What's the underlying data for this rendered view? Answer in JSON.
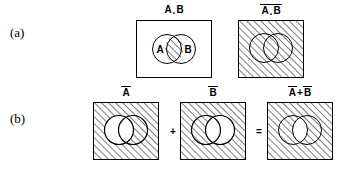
{
  "figure": {
    "rows": [
      {
        "id": "a",
        "label": "(a)",
        "panels": [
          {
            "id": "a-and-b",
            "label_parts": {
              "left": "A",
              "op": ".",
              "right": "B"
            },
            "label_plain": "A . B",
            "overbar": "none",
            "fill": "white",
            "shaded_region": "intersection",
            "circle_labels": {
              "left": "A",
              "right": "B"
            },
            "show_circle_labels": true
          },
          {
            "id": "not-a-and-b",
            "label_parts": {
              "left": "A",
              "op": ".",
              "right": "B"
            },
            "label_plain": "A . B",
            "overbar": "full",
            "fill": "hatched",
            "shaded_region": "everything",
            "circle_labels": {
              "left": "",
              "right": ""
            },
            "show_circle_labels": false
          }
        ]
      },
      {
        "id": "b",
        "label": "(b)",
        "panels": [
          {
            "id": "not-a",
            "label_parts": {
              "left": "A",
              "op": "",
              "right": ""
            },
            "label_plain": "A",
            "overbar": "left",
            "fill": "hatched",
            "shaded_region": "outside-circle-a",
            "circle_labels": {
              "left": "",
              "right": ""
            },
            "show_circle_labels": false
          },
          {
            "id": "not-b",
            "label_parts": {
              "left": "B",
              "op": "",
              "right": ""
            },
            "label_plain": "B",
            "overbar": "left",
            "fill": "hatched",
            "shaded_region": "outside-circle-b",
            "circle_labels": {
              "left": "",
              "right": ""
            },
            "show_circle_labels": false
          },
          {
            "id": "not-a-plus-not-b",
            "label_parts": {
              "left": "A",
              "op": "+",
              "right": "B"
            },
            "label_plain": "A + B",
            "overbar": "each",
            "fill": "hatched",
            "shaded_region": "outside-intersection",
            "circle_labels": {
              "left": "",
              "right": ""
            },
            "show_circle_labels": false
          }
        ],
        "operators": [
          {
            "id": "plus",
            "symbol": "+"
          },
          {
            "id": "equals",
            "symbol": "="
          }
        ]
      }
    ]
  },
  "style": {
    "ink": "#000000",
    "paper": "#ffffff",
    "hatch_angle_deg": 45,
    "hatch_spacing_px": 5
  }
}
